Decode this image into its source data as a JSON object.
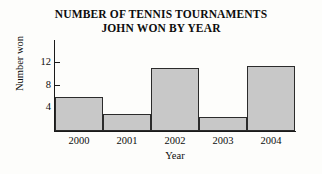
{
  "chart_data": {
    "type": "bar",
    "title": "NUMBER OF TENNIS TOURNAMENTS JOHN WON BY YEAR",
    "title_line1": "NUMBER OF TENNIS TOURNAMENTS",
    "title_line2": "JOHN WON BY YEAR",
    "categories": [
      "2000",
      "2001",
      "2002",
      "2003",
      "2004"
    ],
    "values": [
      6,
      3,
      11,
      2.5,
      11.5
    ],
    "xlabel": "Year",
    "ylabel": "Number won",
    "ylim": [
      0,
      16
    ],
    "yticks": [
      4,
      8,
      12
    ],
    "ytick_labels": [
      "4",
      "8",
      "12"
    ],
    "grid": false,
    "legend": false,
    "bar_fill_color": "#c8c8c8",
    "bar_edge_color": "#2b2b2b",
    "axis_color": "#1a1a1a",
    "background_color": "#fdfdfb"
  }
}
